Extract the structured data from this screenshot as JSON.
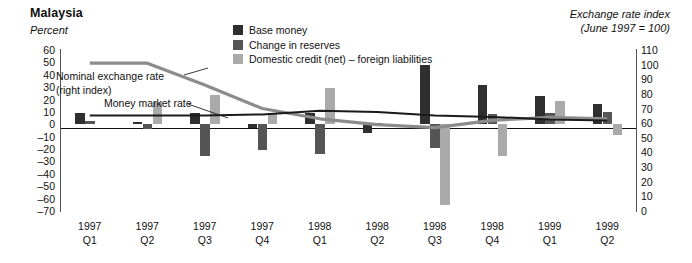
{
  "header": {
    "title": "Malaysia",
    "left_axis_units": "Percent",
    "right_axis_title_line1": "Exchange rate index",
    "right_axis_title_line2": "(June 1997 = 100)"
  },
  "legend": {
    "items": [
      {
        "label": "Base money",
        "color": "#2f2f2f",
        "swatch_name": "legend-swatch-base-money"
      },
      {
        "label": "Change in reserves",
        "color": "#555555",
        "swatch_name": "legend-swatch-change-in-reserves"
      },
      {
        "label": "Domestic credit (net) – foreign liabilities",
        "color": "#aaaaaa",
        "swatch_name": "legend-swatch-domestic-credit"
      }
    ]
  },
  "annotations": [
    {
      "name": "annotation-nominal-exchange-rate",
      "line1": "Nominal exchange rate",
      "line2": "(right index)"
    },
    {
      "name": "annotation-money-market-rate",
      "line1": "Money market rate",
      "line2": ""
    }
  ],
  "chart_data": {
    "type": "bar",
    "title": "Malaysia",
    "xlabel": "",
    "ylabel": "Percent",
    "y2label": "Exchange rate index (June 1997 = 100)",
    "grid": false,
    "legend_position": "top-center",
    "ylim": [
      -70,
      60
    ],
    "yticks": [
      60,
      50,
      40,
      30,
      20,
      10,
      0,
      -10,
      -20,
      -30,
      -40,
      -50,
      -60,
      -70
    ],
    "ytick_labels": [
      "60",
      "50",
      "40",
      "30",
      "20",
      "10",
      "0",
      "–10",
      "–20",
      "–30",
      "–40",
      "–50",
      "–60",
      "–70"
    ],
    "y2lim": [
      0,
      110
    ],
    "y2ticks": [
      110,
      100,
      90,
      80,
      70,
      60,
      50,
      40,
      30,
      20,
      10,
      0
    ],
    "y2tick_labels": [
      "110",
      "100",
      "90",
      "80",
      "70",
      "60",
      "50",
      "40",
      "30",
      "20",
      "10",
      "0"
    ],
    "categories": [
      "1997 Q1",
      "1997 Q2",
      "1997 Q3",
      "1997 Q4",
      "1998 Q1",
      "1998 Q2",
      "1998 Q3",
      "1998 Q4",
      "1999 Q1",
      "1999 Q2"
    ],
    "category_lines": [
      [
        "1997",
        "Q1"
      ],
      [
        "1997",
        "Q2"
      ],
      [
        "1997",
        "Q3"
      ],
      [
        "1997",
        "Q4"
      ],
      [
        "1998",
        "Q1"
      ],
      [
        "1998",
        "Q2"
      ],
      [
        "1998",
        "Q3"
      ],
      [
        "1998",
        "Q4"
      ],
      [
        "1999",
        "Q1"
      ],
      [
        "1999",
        "Q2"
      ]
    ],
    "series": [
      {
        "name": "Base money",
        "color": "#2f2f2f",
        "axis": "left",
        "values": [
          9,
          2,
          9,
          -3,
          9,
          -7,
          48,
          32,
          23,
          16
        ]
      },
      {
        "name": "Change in reserves",
        "color": "#555555",
        "axis": "left",
        "values": [
          3,
          -4,
          -26,
          -21,
          -24,
          1,
          -19,
          8,
          9,
          10
        ]
      },
      {
        "name": "Domestic credit (net) – foreign liabilities",
        "color": "#aaaaaa",
        "axis": "left",
        "values": [
          0,
          18,
          24,
          9,
          29,
          0,
          -65,
          -26,
          19,
          -9
        ]
      }
    ],
    "lines": [
      {
        "name": "Nominal exchange rate (right index)",
        "color": "#8c8c8c",
        "axis": "right",
        "width": 3.2,
        "values": [
          101,
          101,
          86,
          70,
          63,
          59,
          57,
          62,
          64,
          63
        ]
      },
      {
        "name": "Money market rate",
        "color": "#1a1a1a",
        "axis": "left",
        "width": 2.0,
        "values": [
          7,
          7,
          7,
          8,
          11,
          10,
          7,
          6,
          4,
          3
        ]
      }
    ]
  }
}
